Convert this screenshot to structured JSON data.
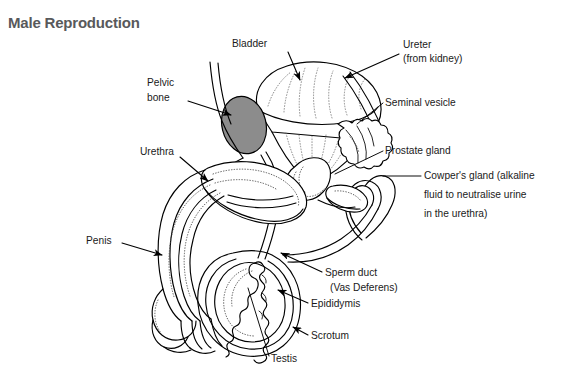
{
  "page": {
    "title": "Male Reproduction",
    "title_color": "#58595b",
    "background": "#ffffff",
    "width": 577,
    "height": 386
  },
  "diagram": {
    "type": "labelled-anatomical-diagram",
    "line_color": "#000000",
    "bone_fill_color": "#8c8c8c",
    "labels": [
      {
        "id": "bladder",
        "lines": [
          "Bladder"
        ],
        "text_x": 232,
        "text_y": 47,
        "connector": "arrow",
        "arrow_from": [
          288,
          52
        ],
        "arrow_to": [
          300,
          80
        ]
      },
      {
        "id": "ureter",
        "lines": [
          "Ureter",
          "(from kidney)"
        ],
        "text_x": 403,
        "text_y": 48,
        "connector": "arrow",
        "arrow_from": [
          399,
          54
        ],
        "arrow_to": [
          345,
          78
        ]
      },
      {
        "id": "pelvic-bone",
        "lines": [
          "Pelvic",
          "bone"
        ],
        "text_x": 147,
        "text_y": 86,
        "connector": "arrow",
        "arrow_from": [
          188,
          101
        ],
        "arrow_to": [
          231,
          115
        ]
      },
      {
        "id": "seminal-vesicle",
        "lines": [
          "Seminal vesicle"
        ],
        "text_x": 385,
        "text_y": 106,
        "connector": "line",
        "arrow_from": [
          383,
          103
        ],
        "arrow_to": [
          357,
          124
        ]
      },
      {
        "id": "prostate-gland",
        "lines": [
          "Prostate gland"
        ],
        "text_x": 385,
        "text_y": 154,
        "connector": "line",
        "arrow_from": [
          383,
          151
        ],
        "arrow_to": [
          333,
          174
        ]
      },
      {
        "id": "urethra",
        "lines": [
          "Urethra"
        ],
        "text_x": 140,
        "text_y": 155,
        "connector": "arrow",
        "arrow_from": [
          180,
          157
        ],
        "arrow_to": [
          208,
          181
        ]
      },
      {
        "id": "cowpers-gland",
        "lines": [
          "Cowper's gland (alkaline",
          "fluid to neutralise urine",
          "in the urethra)"
        ],
        "text_x": 424,
        "text_y": 179,
        "connector": "line",
        "arrow_from": [
          421,
          176
        ],
        "arrow_to": [
          381,
          176
        ]
      },
      {
        "id": "penis",
        "lines": [
          "Penis"
        ],
        "text_x": 86,
        "text_y": 244,
        "connector": "arrow",
        "arrow_from": [
          122,
          243
        ],
        "arrow_to": [
          162,
          255
        ]
      },
      {
        "id": "sperm-duct",
        "lines": [
          "Sperm duct",
          "(Vas Deferens)"
        ],
        "text_x": 325,
        "text_y": 276,
        "connector": "arrow",
        "arrow_from": [
          322,
          272
        ],
        "arrow_to": [
          281,
          253
        ]
      },
      {
        "id": "epididymis",
        "lines": [
          "Epididymis"
        ],
        "text_x": 311,
        "text_y": 307,
        "connector": "arrow",
        "arrow_from": [
          308,
          303
        ],
        "arrow_to": [
          278,
          290
        ]
      },
      {
        "id": "scrotum",
        "lines": [
          "Scrotum"
        ],
        "text_x": 311,
        "text_y": 339,
        "connector": "arrow",
        "arrow_from": [
          308,
          335
        ],
        "arrow_to": [
          293,
          327
        ]
      },
      {
        "id": "testis",
        "lines": [
          "Testis"
        ],
        "text_x": 271,
        "text_y": 362,
        "connector": "line",
        "arrow_from": [
          269,
          356
        ],
        "arrow_to": [
          248,
          288
        ]
      }
    ],
    "structures": [
      "bladder",
      "ureter",
      "pelvic-bone",
      "seminal-vesicle",
      "prostate-gland",
      "cowpers-gland",
      "urethra",
      "penis",
      "vas-deferens-loop",
      "testis",
      "epididymis",
      "scrotum"
    ]
  }
}
